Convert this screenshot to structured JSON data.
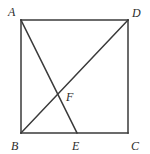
{
  "figure": {
    "kind": "geometry-diagram",
    "shape": "square-with-cevian-and-diagonal",
    "canvas": {
      "width": 150,
      "height": 154
    },
    "background_color": "#ffffff",
    "stroke_color": "#3a3a3a",
    "label_color": "#2b2b2b",
    "stroke_width": 1.5,
    "vertices": [
      {
        "id": "A",
        "label": "A",
        "x": 21,
        "y": 20,
        "label_x": 8,
        "label_y": 16,
        "role": "square-corner-top-left"
      },
      {
        "id": "D",
        "label": "D",
        "x": 128,
        "y": 20,
        "label_x": 132,
        "label_y": 17,
        "role": "square-corner-top-right"
      },
      {
        "id": "B",
        "label": "B",
        "x": 21,
        "y": 133,
        "label_x": 11,
        "label_y": 150,
        "role": "square-corner-bottom-left"
      },
      {
        "id": "C",
        "label": "C",
        "x": 128,
        "y": 133,
        "label_x": 131,
        "label_y": 150,
        "role": "square-corner-bottom-right"
      },
      {
        "id": "E",
        "label": "E",
        "x": 77,
        "y": 133,
        "label_x": 72,
        "label_y": 150,
        "role": "point-on-bottom-edge"
      },
      {
        "id": "F",
        "label": "F",
        "x": 62,
        "y": 94,
        "label_x": 66,
        "label_y": 101,
        "role": "intersection-point"
      }
    ],
    "segments": [
      {
        "id": "AD",
        "from": "A",
        "to": "D",
        "x1": 21,
        "y1": 20,
        "x2": 128,
        "y2": 20,
        "kind": "square-side-top"
      },
      {
        "id": "DC",
        "from": "D",
        "to": "C",
        "x1": 128,
        "y1": 20,
        "x2": 128,
        "y2": 133,
        "kind": "square-side-right"
      },
      {
        "id": "CB",
        "from": "C",
        "to": "B",
        "x1": 128,
        "y1": 133,
        "x2": 21,
        "y2": 133,
        "kind": "square-side-bottom"
      },
      {
        "id": "BA",
        "from": "B",
        "to": "A",
        "x1": 21,
        "y1": 133,
        "x2": 21,
        "y2": 20,
        "kind": "square-side-left"
      },
      {
        "id": "AE",
        "from": "A",
        "to": "E",
        "x1": 21,
        "y1": 20,
        "x2": 77,
        "y2": 133,
        "kind": "cevian"
      },
      {
        "id": "BD",
        "from": "B",
        "to": "D",
        "x1": 21,
        "y1": 133,
        "x2": 128,
        "y2": 20,
        "kind": "diagonal"
      }
    ]
  }
}
